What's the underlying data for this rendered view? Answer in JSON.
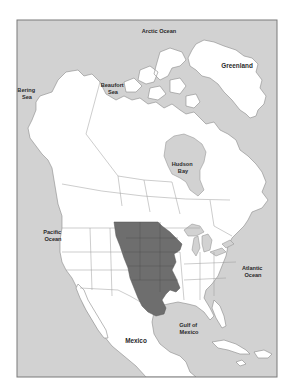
{
  "map": {
    "subject": "North America",
    "colors": {
      "ocean": "#d2d2d2",
      "land": "#ffffff",
      "highlighted_region": "#6e6e6e",
      "borders": "#9a9a9a"
    },
    "highlighted_region": {
      "description": "Shaded central interior region (Great Plains of the United States)"
    },
    "labels": {
      "arctic_ocean": "Arctic Ocean",
      "greenland": "Greenland",
      "bering_sea": [
        "Bering",
        "Sea"
      ],
      "beaufort_sea": [
        "Beaufort",
        "Sea"
      ],
      "hudson_bay": [
        "Hudson",
        "Bay"
      ],
      "pacific_ocean": [
        "Pacific",
        "Ocean"
      ],
      "atlantic_ocean": [
        "Atlantic",
        "Ocean"
      ],
      "gulf_of_mexico": [
        "Gulf of",
        "Mexico"
      ],
      "mexico": "Mexico"
    }
  }
}
